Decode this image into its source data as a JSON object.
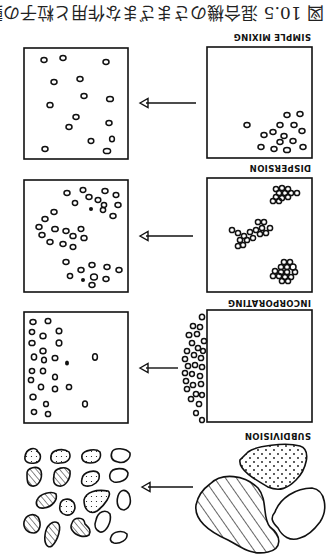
{
  "figure": {
    "orientation": "rotated 180 degrees",
    "caption": "図 10.5 混合機のさまざまな作用と粒子の動き",
    "caption_visible_fragment": "図 10.5",
    "stages": [
      {
        "id": "simple-mixing",
        "label": "SIMPLE MIXING",
        "before": "particles clustered in lower corner",
        "after": "particles evenly scattered"
      },
      {
        "id": "dispersion",
        "label": "DISPERSION",
        "before": "three agglomerate clusters",
        "after": "dispersed individual particles"
      },
      {
        "id": "incorporating",
        "label": "INCORPORATING",
        "before": "particles outside box boundary",
        "after": "particles incorporated near one side"
      },
      {
        "id": "subdivision",
        "label": "SUBDIVISION",
        "before": "three large lumps (hatched, dotted, plain)",
        "after": "many small hatched, dotted and plain pieces"
      }
    ],
    "colors": {
      "ink": "#111111",
      "background": "#ffffff"
    }
  }
}
